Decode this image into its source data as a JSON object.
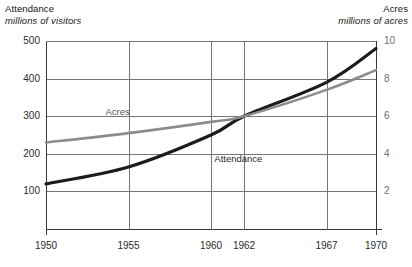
{
  "chart_data": {
    "type": "line",
    "title": "",
    "x": [
      1950,
      1955,
      1960,
      1962,
      1967,
      1970
    ],
    "xlabel": "",
    "x_tick_labels": [
      "1950",
      "1955",
      "1960",
      "1962",
      "1967",
      "1970"
    ],
    "xlim": [
      1950,
      1970
    ],
    "grid": true,
    "legend_position": "inline-annotations",
    "left_axis": {
      "title": "Attendance",
      "subtitle": "millions of visitors",
      "tick_labels": [
        "500",
        "400",
        "300",
        "200",
        "100"
      ],
      "ticks": [
        500,
        400,
        300,
        200,
        100
      ],
      "ylim": [
        0,
        500
      ],
      "unit": "millions of visitors"
    },
    "right_axis": {
      "title": "Acres",
      "subtitle": "millions of acres",
      "tick_labels": [
        "10",
        "8",
        "6",
        "4",
        "2"
      ],
      "ticks": [
        10,
        8,
        6,
        4,
        2
      ],
      "ylim": [
        0,
        10
      ],
      "unit": "millions of acres"
    },
    "series": [
      {
        "name": "Attendance",
        "axis": "left",
        "color": "#1c1c1c",
        "label": "Attendance",
        "label_x": 1960.2,
        "label_y": 185,
        "values": [
          120,
          165,
          250,
          300,
          390,
          480
        ],
        "x": [
          1950,
          1955,
          1960,
          1962,
          1967,
          1970
        ]
      },
      {
        "name": "Acres",
        "axis": "right",
        "color": "#8c8c8c",
        "label": "Acres",
        "label_x": 1953.6,
        "label_y": 6.25,
        "values": [
          4.6,
          5.1,
          5.7,
          6.0,
          7.4,
          8.45
        ],
        "x": [
          1950,
          1955,
          1960,
          1962,
          1967,
          1970
        ]
      }
    ],
    "annotations": [
      {
        "text": "Acres",
        "series": "Acres"
      },
      {
        "text": "Attendance",
        "series": "Attendance"
      }
    ]
  },
  "left_axis_title": {
    "main": "Attendance",
    "sub": "millions of visitors"
  },
  "right_axis_title": {
    "main": "Acres",
    "sub": "millions of acres"
  },
  "ticks": {
    "left": [
      "500",
      "400",
      "300",
      "200",
      "100"
    ],
    "right": [
      "10",
      "8",
      "6",
      "4",
      "2"
    ],
    "x": [
      "1950",
      "1955",
      "1960",
      "1962",
      "1967",
      "1970"
    ]
  },
  "series_labels": {
    "acres": "Acres",
    "attendance": "Attendance"
  },
  "colors": {
    "attendance": "#1c1c1c",
    "acres": "#8c8c8c",
    "grid": "#777777",
    "axis": "#3a3a3a"
  }
}
